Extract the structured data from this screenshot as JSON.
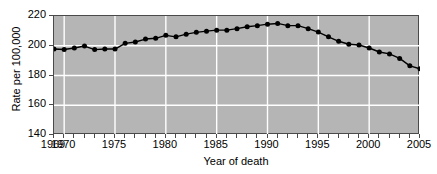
{
  "chart_data": {
    "type": "line",
    "title": "",
    "xlabel": "Year of death",
    "ylabel": "Rate per 100,000",
    "xlim": [
      1969,
      2005
    ],
    "ylim": [
      140,
      220
    ],
    "grid": true,
    "legend": null,
    "y_ticks": [
      220,
      200,
      180,
      160,
      140
    ],
    "x_ticks": [
      1969,
      1970,
      1975,
      1980,
      1985,
      1990,
      1995,
      2000,
      2005
    ],
    "x_minor_tick_interval": 1,
    "marker": "filled-circle",
    "series": [
      {
        "name": "Rate per 100,000",
        "x": [
          1969,
          1970,
          1971,
          1972,
          1973,
          1974,
          1975,
          1976,
          1977,
          1978,
          1979,
          1980,
          1981,
          1982,
          1983,
          1984,
          1985,
          1986,
          1987,
          1988,
          1989,
          1990,
          1991,
          1992,
          1993,
          1994,
          1995,
          1996,
          1997,
          1998,
          1999,
          2000,
          2001,
          2002,
          2003,
          2004,
          2005
        ],
        "values": [
          197.8,
          197.5,
          198.5,
          199.8,
          197.4,
          197.8,
          197.8,
          201.6,
          202.5,
          204.5,
          205.0,
          207.0,
          206.0,
          207.8,
          209.0,
          209.8,
          210.5,
          210.5,
          211.5,
          212.8,
          213.5,
          214.5,
          215.0,
          213.5,
          213.5,
          211.5,
          209.2,
          206.0,
          203.0,
          201.0,
          200.5,
          198.5,
          195.8,
          194.5,
          191.5,
          186.5,
          184.5
        ]
      }
    ]
  },
  "axis_titles": {
    "x": "Year of death",
    "y": "Rate per 100,000"
  },
  "colors": {
    "panel_background": "#b5b5b5",
    "gridline": "#ffffff",
    "series_line": "#000000",
    "marker_fill": "#000000",
    "axis": "#4a4a4a",
    "page_background": "#ffffff"
  }
}
